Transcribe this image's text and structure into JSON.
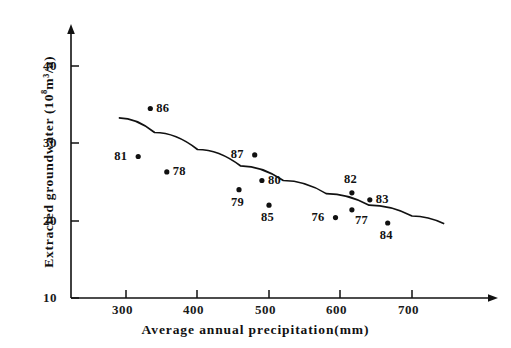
{
  "chart_data": {
    "type": "scatter",
    "title": "",
    "xlabel": "Average annual precipitation(mm)",
    "ylabel": "Extracted groundwater (10⁸m³/a)",
    "ylabel_prefix": "Extracted groundwater (10",
    "ylabel_exponent": "8",
    "ylabel_suffix": "m³/a)",
    "xlim": [
      215,
      760
    ],
    "ylim": [
      10,
      46
    ],
    "xticks": [
      300,
      400,
      500,
      600,
      700
    ],
    "yticks": [
      40,
      30,
      20,
      10
    ],
    "xtick_labels": [
      "300",
      "400",
      "500",
      "600",
      "700"
    ],
    "ytick_labels": [
      "40",
      "30",
      "20",
      "10"
    ],
    "grid": false,
    "legend": "none",
    "points": [
      {
        "label": "86",
        "x": 334,
        "y": 34.5,
        "label_pos": "right"
      },
      {
        "label": "81",
        "x": 317,
        "y": 28.3,
        "label_pos": "left"
      },
      {
        "label": "78",
        "x": 357,
        "y": 26.3,
        "label_pos": "right"
      },
      {
        "label": "87",
        "x": 480,
        "y": 28.5,
        "label_pos": "left"
      },
      {
        "label": "80",
        "x": 490,
        "y": 25.2,
        "label_pos": "right"
      },
      {
        "label": "79",
        "x": 458,
        "y": 24.0,
        "label_pos": "below"
      },
      {
        "label": "85",
        "x": 500,
        "y": 22.0,
        "label_pos": "below"
      },
      {
        "label": "82",
        "x": 616,
        "y": 23.6,
        "label_pos": "above"
      },
      {
        "label": "83",
        "x": 641,
        "y": 22.7,
        "label_pos": "right"
      },
      {
        "label": "76",
        "x": 593,
        "y": 20.4,
        "label_pos": "left"
      },
      {
        "label": "77",
        "x": 616,
        "y": 21.4,
        "label_pos": "below-right"
      },
      {
        "label": "84",
        "x": 666,
        "y": 19.7,
        "label_pos": "below"
      }
    ],
    "trend_curve": {
      "description": "fitted decreasing curve",
      "x_start": 290,
      "x_end": 745,
      "points": [
        [
          290,
          33.3
        ],
        [
          340,
          31.4
        ],
        [
          400,
          29.2
        ],
        [
          460,
          27.1
        ],
        [
          520,
          25.2
        ],
        [
          580,
          23.5
        ],
        [
          640,
          22.0
        ],
        [
          700,
          20.6
        ],
        [
          745,
          19.6
        ]
      ]
    }
  }
}
